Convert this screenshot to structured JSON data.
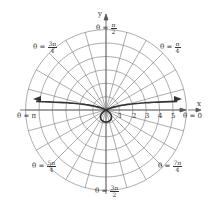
{
  "chart_data": {
    "type": "polar-plot",
    "title": "",
    "grid": {
      "rings": [
        1,
        2,
        3,
        4,
        5,
        6
      ],
      "spokes_every_rad": "π/12",
      "color": "#8a8a8a"
    },
    "axes": {
      "x_label": "x",
      "y_label": "y",
      "r_tick_labels": [
        "1",
        "2",
        "3",
        "4",
        "5"
      ]
    },
    "angle_labels": [
      {
        "theta": "0",
        "text": "θ = 0"
      },
      {
        "theta": "π/4",
        "lhs": "θ =",
        "num": "π",
        "den": "4"
      },
      {
        "theta": "π/2",
        "lhs": "θ =",
        "num": "π",
        "den": "2"
      },
      {
        "theta": "3π/4",
        "lhs": "θ =",
        "num": "3π",
        "den": "4"
      },
      {
        "theta": "π",
        "text": "θ = π"
      },
      {
        "theta": "5π/4",
        "lhs": "θ =",
        "num": "5π",
        "den": "4"
      },
      {
        "theta": "3π/2",
        "lhs": "θ =",
        "num": "3π",
        "den": "2"
      },
      {
        "theta": "7π/4",
        "lhs": "θ =",
        "num": "7π",
        "den": "4"
      }
    ],
    "curve": {
      "description": "conchoid-like curve with horizontal asymptote above x-axis and small inner loop below origin",
      "color": "#333333"
    }
  },
  "labels": {
    "x": "x",
    "y": "y",
    "r1": "1",
    "r2": "2",
    "r3": "3",
    "r4": "4",
    "r5": "5",
    "t0": "θ = 0",
    "tpi": "θ = π",
    "eq": "θ =",
    "pi": "π",
    "three_pi": "3π",
    "five_pi": "5π",
    "seven_pi": "7π",
    "d2": "2",
    "d4": "4"
  }
}
